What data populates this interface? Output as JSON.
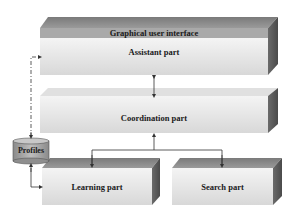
{
  "diagram": {
    "blocks": [
      {
        "id": "gui",
        "label": "Graphical user interface"
      },
      {
        "id": "assistant",
        "label": "Assistant part"
      },
      {
        "id": "coordination",
        "label": "Coordination part"
      },
      {
        "id": "learning",
        "label": "Learning part"
      },
      {
        "id": "search",
        "label": "Search part"
      }
    ],
    "datastore": {
      "id": "profiles",
      "label": "Profiles"
    },
    "edges": [
      {
        "from": "assistant",
        "to": "coordination",
        "style": "solid",
        "direction": "both"
      },
      {
        "from": "learning",
        "to": "coordination",
        "style": "solid",
        "direction": "to-coordination"
      },
      {
        "from": "coordination",
        "to": "learning",
        "style": "solid",
        "direction": "down"
      },
      {
        "from": "coordination",
        "to": "search",
        "style": "solid",
        "direction": "down"
      },
      {
        "from": "profiles",
        "to": "assistant",
        "style": "dashed",
        "direction": "both"
      },
      {
        "from": "profiles",
        "to": "learning",
        "style": "solid",
        "direction": "both"
      }
    ],
    "colors": {
      "top_face": "#8a8a8a",
      "side_face": "#555555",
      "front_face": "#e6e6e6",
      "gui_band": "#a8a8a8",
      "cylinder": "#a0a0a0",
      "line": "#333333"
    }
  }
}
